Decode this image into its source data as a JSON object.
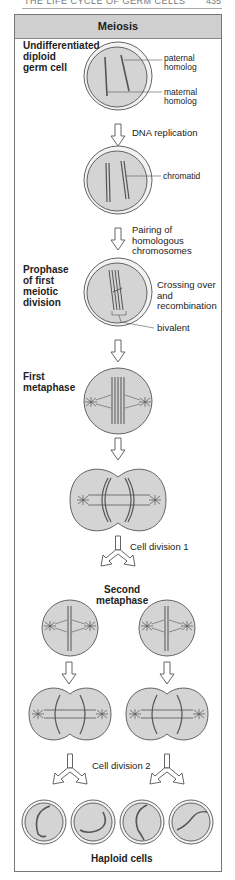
{
  "running_header": {
    "left": "THE LIFE CYCLE OF GERM CELLS",
    "right": "435"
  },
  "title": "Meiosis",
  "colors": {
    "cell_fill": "#d4d4d4",
    "cell_stroke": "#555555",
    "chromosome": "#555555",
    "title_bar": "#cfcfcf",
    "arrow_fill": "#ffffff"
  },
  "stages": [
    {
      "id": "germ-cell",
      "label": [
        "Undifferentiated",
        "diploid",
        "germ cell"
      ],
      "annotations": [
        "paternal homolog",
        "maternal homolog"
      ]
    },
    {
      "id": "dna-replication-step",
      "label": [
        "DNA replication"
      ]
    },
    {
      "id": "replicated-cell",
      "annotations": [
        "chromatid"
      ]
    },
    {
      "id": "pairing-step",
      "label": [
        "Pairing of",
        "homologous",
        "chromosomes"
      ]
    },
    {
      "id": "prophase",
      "label": [
        "Prophase",
        "of first",
        "meiotic",
        "division"
      ],
      "annotations": [
        "Crossing over",
        "and",
        "recombination",
        "bivalent"
      ]
    },
    {
      "id": "first-metaphase",
      "label": [
        "First",
        "metaphase"
      ]
    },
    {
      "id": "cell-division-1",
      "label": [
        "Cell division 1"
      ]
    },
    {
      "id": "second-metaphase",
      "label": [
        "Second",
        "metaphase"
      ]
    },
    {
      "id": "cell-division-2",
      "label": [
        "Cell division 2"
      ]
    },
    {
      "id": "haploid-cells",
      "label": [
        "Haploid cells"
      ]
    }
  ],
  "labels": {
    "germ_1": "Undifferentiated",
    "germ_2": "diploid",
    "germ_3": "germ cell",
    "paternal_1": "paternal",
    "paternal_2": "homolog",
    "maternal_1": "maternal",
    "maternal_2": "homolog",
    "dna_replication": "DNA replication",
    "chromatid": "chromatid",
    "pairing_1": "Pairing of",
    "pairing_2": "homologous",
    "pairing_3": "chromosomes",
    "prophase_1": "Prophase",
    "prophase_2": "of first",
    "prophase_3": "meiotic",
    "prophase_4": "division",
    "crossing_1": "Crossing over",
    "crossing_2": "and",
    "crossing_3": "recombination",
    "bivalent": "bivalent",
    "first_meta_1": "First",
    "first_meta_2": "metaphase",
    "division_1": "Cell division 1",
    "second_meta_1": "Second",
    "second_meta_2": "metaphase",
    "division_2": "Cell division 2",
    "haploid": "Haploid cells"
  }
}
